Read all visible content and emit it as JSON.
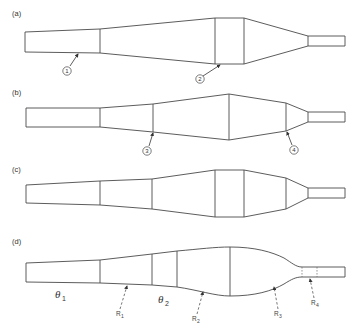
{
  "figure": {
    "panels": [
      {
        "id": "a",
        "label": "(a)",
        "callouts": [
          {
            "id": "callout-1",
            "text": "1"
          },
          {
            "id": "callout-2",
            "text": "2"
          }
        ]
      },
      {
        "id": "b",
        "label": "(b)",
        "callouts": [
          {
            "id": "callout-3",
            "text": "3"
          },
          {
            "id": "callout-4",
            "text": "4"
          }
        ]
      },
      {
        "id": "c",
        "label": "(c)",
        "callouts": []
      },
      {
        "id": "d",
        "label": "(d)",
        "angles": [
          {
            "symbol": "θ",
            "subscript": "1"
          },
          {
            "symbol": "θ",
            "subscript": "2"
          }
        ],
        "radii": [
          {
            "symbol": "R",
            "subscript": "1"
          },
          {
            "symbol": "R",
            "subscript": "2"
          },
          {
            "symbol": "R",
            "subscript": "3"
          },
          {
            "symbol": "R",
            "subscript": "4"
          }
        ]
      }
    ],
    "colors": {
      "stroke": "#4a4a4a",
      "background": "#ffffff"
    }
  }
}
